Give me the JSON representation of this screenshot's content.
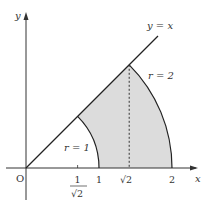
{
  "diagram": {
    "type": "polar-region",
    "colors": {
      "axis": "#333333",
      "curve": "#222222",
      "fill": "#dcdcdc",
      "background": "#ffffff"
    },
    "axes": {
      "x_label": "x",
      "y_label": "y",
      "origin_label": "O"
    },
    "curves": {
      "line_label": "y = x",
      "inner_arc_label": "r = 1",
      "outer_arc_label": "r = 2"
    },
    "ticks": {
      "inv_sqrt2_num": "1",
      "inv_sqrt2_den": "√2",
      "one": "1",
      "sqrt2": "√2",
      "two": "2"
    }
  }
}
